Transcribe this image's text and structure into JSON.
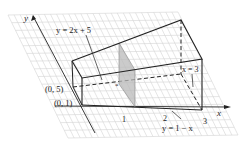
{
  "diagram": {
    "axes": {
      "x_label": "x",
      "y_label": "y"
    },
    "x_ticks": [
      "1",
      "2",
      "3"
    ],
    "point_labels": {
      "p05": "(0, 5)",
      "p01": "(0, 1)"
    },
    "curve_labels": {
      "upper": "y = 2x + 5",
      "lower": "y = 1 − x",
      "right": "x = 3"
    },
    "colors": {
      "grid": "#d4d4d4",
      "edges": "#222222",
      "section_fill": "#b9b9b9"
    }
  }
}
